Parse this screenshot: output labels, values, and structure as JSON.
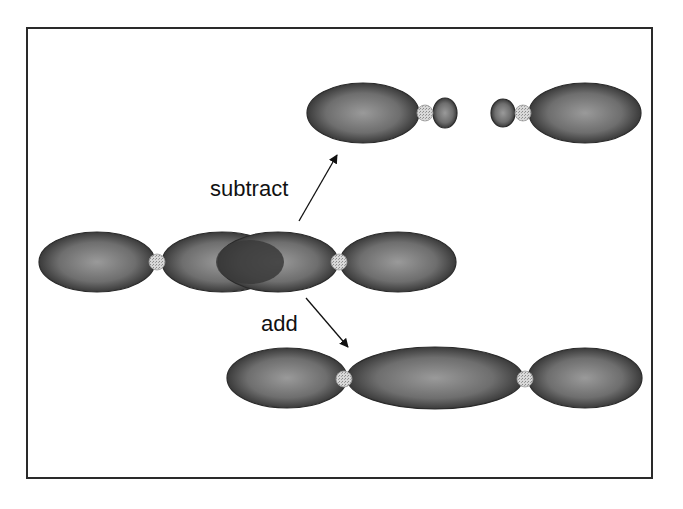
{
  "labels": {
    "subtract": "subtract",
    "add": "add"
  },
  "colors": {
    "frame": "#2a2a2a",
    "chromosome_dark": "#2b2b2b",
    "chromosome_mid": "#6e6e6e",
    "chromosome_light": "#9a9a9a",
    "overlap": "#3a3a3a",
    "centromere": "#cfcfcf",
    "arrow": "#111111",
    "background": "#ffffff"
  },
  "frame": {
    "x": 26,
    "y": 27,
    "w": 627,
    "h": 452
  },
  "arrows": [
    {
      "name": "subtract-arrow",
      "x1": 299,
      "y1": 221,
      "x2": 337,
      "y2": 155
    },
    {
      "name": "add-arrow",
      "x1": 306,
      "y1": 298,
      "x2": 348,
      "y2": 347
    }
  ],
  "chromosomes": {
    "original": {
      "arms": [
        {
          "cx": 97,
          "cy": 262,
          "rx": 58,
          "ry": 30
        },
        {
          "cx": 222,
          "cy": 262,
          "rx": 60,
          "ry": 30
        },
        {
          "cx": 278,
          "cy": 262,
          "rx": 60,
          "ry": 30
        },
        {
          "cx": 398,
          "cy": 262,
          "rx": 58,
          "ry": 30
        }
      ],
      "overlap": {
        "cx": 250,
        "cy": 262,
        "rx": 34,
        "ry": 22
      },
      "centromeres": [
        {
          "cx": 157,
          "cy": 262,
          "r": 8
        },
        {
          "cx": 339,
          "cy": 262,
          "r": 8
        }
      ]
    },
    "subtract_left": {
      "arms": [
        {
          "cx": 363,
          "cy": 113,
          "rx": 56,
          "ry": 30
        },
        {
          "cx": 445,
          "cy": 113,
          "rx": 12,
          "ry": 15
        }
      ],
      "centromeres": [
        {
          "cx": 425,
          "cy": 113,
          "r": 8
        }
      ]
    },
    "subtract_right": {
      "arms": [
        {
          "cx": 503,
          "cy": 113,
          "rx": 12,
          "ry": 14
        },
        {
          "cx": 585,
          "cy": 113,
          "rx": 56,
          "ry": 30
        }
      ],
      "centromeres": [
        {
          "cx": 523,
          "cy": 113,
          "r": 8
        }
      ]
    },
    "added": {
      "arms": [
        {
          "cx": 287,
          "cy": 378,
          "rx": 60,
          "ry": 30
        },
        {
          "cx": 435,
          "cy": 378,
          "rx": 88,
          "ry": 31
        },
        {
          "cx": 585,
          "cy": 378,
          "rx": 57,
          "ry": 30
        }
      ],
      "centromeres": [
        {
          "cx": 344,
          "cy": 379,
          "r": 8
        },
        {
          "cx": 525,
          "cy": 379,
          "r": 8
        }
      ]
    }
  }
}
